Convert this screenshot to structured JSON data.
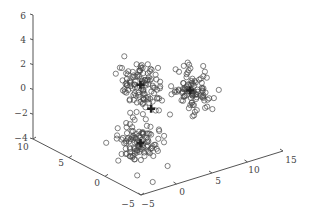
{
  "chart_data": {
    "type": "scatter",
    "projection": "3d",
    "title": "",
    "xlabel": "",
    "ylabel": "",
    "zlabel": "",
    "grid": false,
    "legend": null,
    "axes": {
      "x": {
        "range": [
          -5,
          15
        ],
        "ticks": [
          -5,
          0,
          5,
          10,
          15
        ],
        "labels": [
          "−5",
          "0",
          "5",
          "10",
          "15"
        ]
      },
      "y": {
        "range": [
          -5,
          10
        ],
        "ticks": [
          10,
          5,
          0,
          -5
        ],
        "labels": [
          "10",
          "5",
          "0",
          "−5"
        ]
      },
      "z": {
        "range": [
          -4,
          6
        ],
        "ticks": [
          6,
          4,
          2,
          0,
          -2,
          -4
        ],
        "labels": [
          "6",
          "4",
          "2",
          "0",
          "−2",
          "−4"
        ]
      }
    },
    "marker": "o",
    "series": [
      {
        "name": "cluster-1",
        "center": [
          0,
          0,
          2.5
        ],
        "spread": [
          1.1,
          1.1,
          0.9
        ],
        "n": 110
      },
      {
        "name": "cluster-2",
        "center": [
          0,
          0,
          -2.2
        ],
        "spread": [
          1.1,
          1.1,
          0.8
        ],
        "n": 110
      },
      {
        "name": "cluster-3",
        "center": [
          7,
          0,
          0.8
        ],
        "spread": [
          1.1,
          1.1,
          0.9
        ],
        "n": 100
      }
    ],
    "centroid_markers": [
      {
        "marker": "+",
        "position": [
          1.5,
          0,
          0.3
        ]
      }
    ],
    "colors": {
      "marker": "#444444",
      "axis": "#555555",
      "text": "#444444",
      "background": "#ffffff"
    }
  }
}
